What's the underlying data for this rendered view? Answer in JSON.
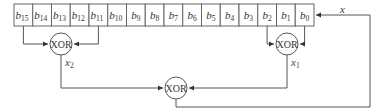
{
  "diagram": {
    "register": {
      "cells": [
        {
          "base": "b",
          "sub": "15"
        },
        {
          "base": "b",
          "sub": "14"
        },
        {
          "base": "b",
          "sub": "13"
        },
        {
          "base": "b",
          "sub": "12"
        },
        {
          "base": "b",
          "sub": "11"
        },
        {
          "base": "b",
          "sub": "10"
        },
        {
          "base": "b",
          "sub": "9"
        },
        {
          "base": "b",
          "sub": "8"
        },
        {
          "base": "b",
          "sub": "7"
        },
        {
          "base": "b",
          "sub": "6"
        },
        {
          "base": "b",
          "sub": "5"
        },
        {
          "base": "b",
          "sub": "4"
        },
        {
          "base": "b",
          "sub": "3"
        },
        {
          "base": "b",
          "sub": "2"
        },
        {
          "base": "b",
          "sub": "1"
        },
        {
          "base": "b",
          "sub": "0"
        }
      ]
    },
    "gates": {
      "left": {
        "label": "XOR",
        "inputs": [
          "b15",
          "b11"
        ],
        "output_label_base": "x",
        "output_label_sub": "2"
      },
      "right": {
        "label": "XOR",
        "inputs": [
          "b2",
          "b0"
        ],
        "output_label_base": "x",
        "output_label_sub": "1"
      },
      "bottom": {
        "label": "XOR",
        "inputs": [
          "x2",
          "x1"
        ]
      }
    },
    "feedback_label": "x",
    "colors": {
      "stroke": "#555555",
      "cell_border": "#666666",
      "background": "#ffffff"
    }
  }
}
